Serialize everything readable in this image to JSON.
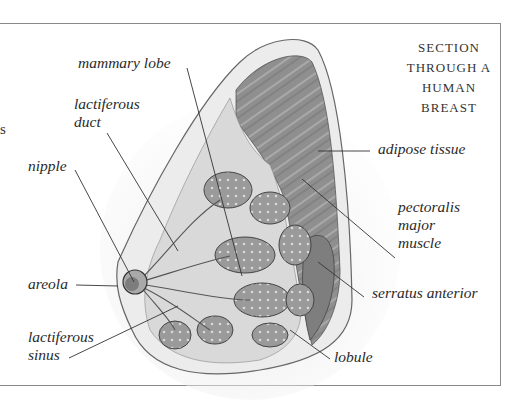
{
  "title": {
    "line1": "SECTION",
    "line2": "THROUGH A",
    "line3": "HUMAN BREAST"
  },
  "stray_glyph": "s",
  "labels": {
    "mammary_lobe": "mammary lobe",
    "lactiferous_duct_1": "lactiferous",
    "lactiferous_duct_2": "duct",
    "nipple": "nipple",
    "areola": "areola",
    "lactiferous_sinus_1": "lactiferous",
    "lactiferous_sinus_2": "sinus",
    "adipose_tissue": "adipose tissue",
    "pectoralis_1": "pectoralis",
    "pectoralis_2": "major",
    "pectoralis_3": "muscle",
    "serratus_anterior": "serratus anterior",
    "lobule": "lobule"
  },
  "colors": {
    "frame": "#8a8a8a",
    "muscle": "#8e8e8e",
    "lobule": "#9c9c9c",
    "fat": "#dcdcdc",
    "leader": "#333333"
  }
}
